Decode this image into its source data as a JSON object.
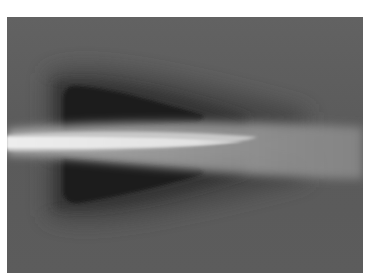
{
  "image": {
    "description": "Grayscale field visualization: bright horizontal jet/streak from left edge with two dark triangular lobes above and below",
    "colors": {
      "background": "#5e5e5e",
      "halo": "#3c3c3c",
      "lobe": "#1c1c1c",
      "streak_core": "#ececec",
      "streak_glow": "#a8a8a8",
      "page": "#ffffff"
    }
  }
}
